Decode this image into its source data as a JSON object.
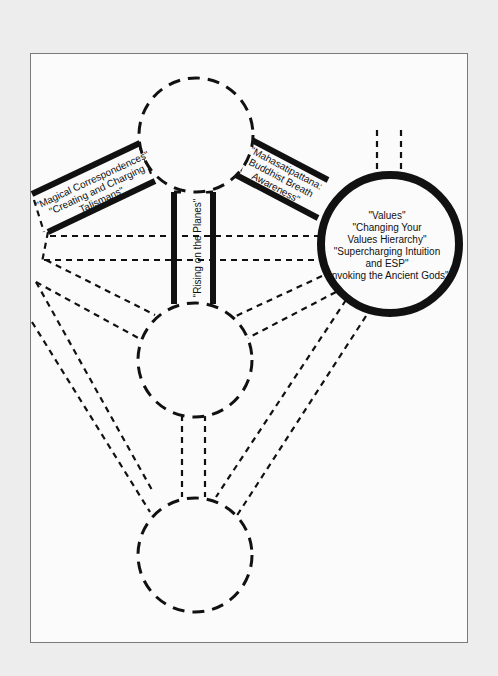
{
  "diagram": {
    "type": "tree-of-life-paths",
    "colors": {
      "background": "#ededed",
      "frame_bg": "#fbfbfb",
      "frame_border": "#7a7a7a",
      "ink": "#111111"
    },
    "nodes": [
      {
        "id": "top",
        "style": "dashed"
      },
      {
        "id": "right-highlighted",
        "style": "solid-thick"
      },
      {
        "id": "middle",
        "style": "dashed"
      },
      {
        "id": "bottom",
        "style": "dashed"
      }
    ],
    "labels": {
      "magical": {
        "line1": "\"Magical Correspondences\"",
        "line2": "\"Creating and Charging",
        "line3": "Talismans\""
      },
      "mahasati": {
        "line1": "\"Mahasatipattana:",
        "line2": "Buddhist Breath",
        "line3": "Awareness\""
      },
      "rising": {
        "line1": "\"Rising on the Planes\""
      },
      "values": {
        "line1": "\"Values\"",
        "line2": "\"Changing Your",
        "line3": "Values Hierarchy\"",
        "line4": "\"Supercharging Intuition",
        "line5": "and ESP\"",
        "line6": "\"Invoking the Ancient Gods\""
      }
    }
  }
}
